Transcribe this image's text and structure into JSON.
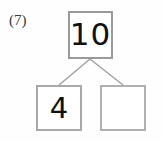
{
  "worksheet": {
    "problem_label": "(7)",
    "type": "number-bond",
    "colors": {
      "page_background": "#fefefe",
      "box_border": "#a6a6a6",
      "connector_line": "#a0a0a0",
      "digit_ink": "#111111",
      "label_ink": "#3a3a3a"
    }
  },
  "number_bond": {
    "whole": {
      "value": "10",
      "filled": true
    },
    "parts": [
      {
        "value": "4",
        "filled": true
      },
      {
        "value": "",
        "filled": false
      }
    ],
    "connectors": [
      {
        "from": [
          90,
          59
        ],
        "to": [
          59,
          85
        ]
      },
      {
        "from": [
          90,
          59
        ],
        "to": [
          123,
          85
        ]
      }
    ]
  }
}
